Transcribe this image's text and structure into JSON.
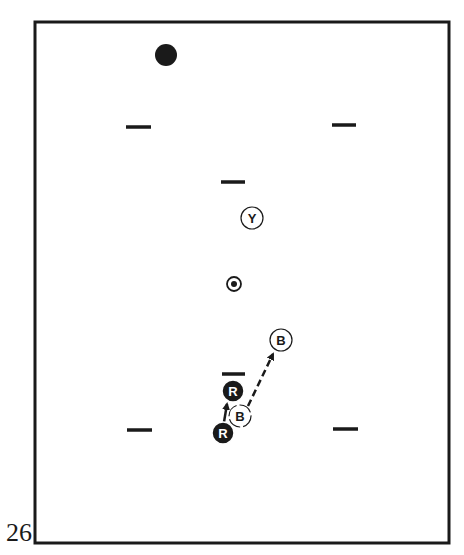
{
  "figure": {
    "number": "26",
    "colors": {
      "ink": "#1a1a1a",
      "paper": "#ffffff"
    },
    "court": {
      "x1": 35,
      "y1": 22,
      "x2": 449,
      "y2": 543,
      "stroke_width": 3
    },
    "stake_ball": {
      "cx": 166,
      "cy": 55,
      "r": 11
    },
    "wickets": [
      {
        "id": "wicket-top-left",
        "x1": 126,
        "x2": 151,
        "y": 127
      },
      {
        "id": "wicket-top-right",
        "x1": 332,
        "x2": 356,
        "y": 125
      },
      {
        "id": "wicket-upper-center",
        "x1": 221,
        "x2": 245,
        "y": 182
      },
      {
        "id": "wicket-lower-center",
        "x1": 222,
        "x2": 245,
        "y": 374
      },
      {
        "id": "wicket-bottom-left",
        "x1": 127,
        "x2": 152,
        "y": 430
      },
      {
        "id": "wicket-bottom-right",
        "x1": 333,
        "x2": 358,
        "y": 429
      }
    ],
    "center_stake": {
      "cx": 234,
      "cy": 284,
      "r": 7,
      "dot_r": 3
    },
    "balls": [
      {
        "id": "ball-yellow",
        "label": "Y",
        "style": "outline",
        "cx": 252,
        "cy": 218,
        "r": 11
      },
      {
        "id": "ball-blue-target",
        "label": "B",
        "style": "outline",
        "cx": 281,
        "cy": 340,
        "r": 11
      },
      {
        "id": "ball-red-target",
        "label": "R",
        "style": "filled",
        "cx": 233,
        "cy": 391,
        "r": 11
      },
      {
        "id": "ball-blue-start",
        "label": "B",
        "style": "outline-dashed",
        "cx": 240,
        "cy": 416,
        "r": 11
      },
      {
        "id": "ball-red-start",
        "label": "R",
        "style": "filled",
        "cx": 223,
        "cy": 433,
        "r": 11
      }
    ],
    "arrows": [
      {
        "id": "arrow-red-path",
        "style": "solid",
        "x1": 224,
        "y1": 422,
        "x2": 227,
        "y2": 404
      },
      {
        "id": "arrow-blue-path",
        "style": "dashed",
        "x1": 248,
        "y1": 406,
        "x2": 273,
        "y2": 354
      }
    ]
  }
}
